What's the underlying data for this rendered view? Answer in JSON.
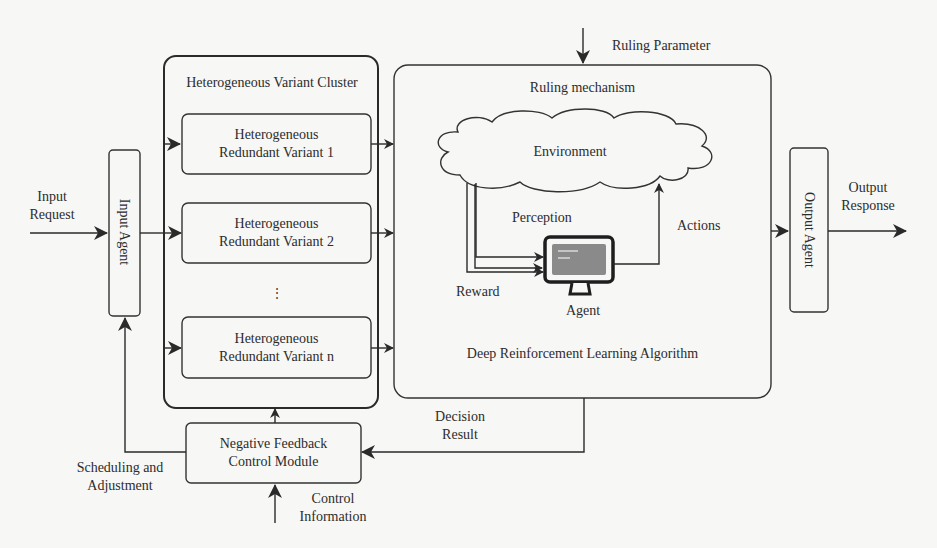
{
  "diagram": {
    "input": {
      "label_line1": "Input",
      "label_line2": "Request",
      "agent_label": "Input Agent"
    },
    "cluster": {
      "title": "Heterogeneous Variant Cluster",
      "variants": [
        {
          "line1": "Heterogeneous",
          "line2": "Redundant Variant 1"
        },
        {
          "line1": "Heterogeneous",
          "line2": "Redundant Variant 2"
        },
        {
          "line1": "Heterogeneous",
          "line2": "Redundant Variant n"
        }
      ],
      "ellipsis": "⋮"
    },
    "ruling": {
      "parameter_label": "Ruling Parameter",
      "title": "Ruling mechanism",
      "environment_label": "Environment",
      "perception_label": "Perception",
      "reward_label": "Reward",
      "actions_label": "Actions",
      "agent_label": "Agent",
      "algorithm_label": "Deep Reinforcement Learning Algorithm"
    },
    "output": {
      "agent_label": "Output Agent",
      "label_line1": "Output",
      "label_line2": "Response"
    },
    "feedback": {
      "module_line1": "Negative Feedback",
      "module_line2": "Control Module",
      "decision_line1": "Decision",
      "decision_line2": "Result",
      "scheduling_line1": "Scheduling and",
      "scheduling_line2": "Adjustment",
      "control_line1": "Control",
      "control_line2": "Information"
    },
    "colors": {
      "stroke": "#2a2a2a",
      "background": "#f7f7f5",
      "screen": "#8a8a8a"
    }
  }
}
